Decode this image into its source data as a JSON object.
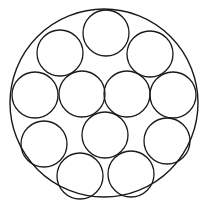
{
  "diagram": {
    "type": "circle-packing",
    "stroke_color": "#1a1a1a",
    "background_color": "#ffffff",
    "outer_circle": {
      "cx": 104,
      "cy": 103,
      "r": 94
    },
    "inner_circle_radius": 23,
    "inner_circles": [
      {
        "id": "top",
        "cx": 106,
        "cy": 33
      },
      {
        "id": "upper-left",
        "cx": 60,
        "cy": 53
      },
      {
        "id": "upper-right",
        "cx": 150,
        "cy": 54
      },
      {
        "id": "middle-far-left",
        "cx": 35,
        "cy": 95
      },
      {
        "id": "middle-center-left",
        "cx": 82,
        "cy": 94
      },
      {
        "id": "middle-center-right",
        "cx": 127,
        "cy": 94
      },
      {
        "id": "middle-far-right",
        "cx": 173,
        "cy": 95
      },
      {
        "id": "lower-left",
        "cx": 44,
        "cy": 144
      },
      {
        "id": "lower-center",
        "cx": 105,
        "cy": 135
      },
      {
        "id": "lower-right",
        "cx": 167,
        "cy": 141
      },
      {
        "id": "bottom-left",
        "cx": 80,
        "cy": 176
      },
      {
        "id": "bottom-right",
        "cx": 131,
        "cy": 174
      }
    ],
    "inner_circle_count": 12
  }
}
